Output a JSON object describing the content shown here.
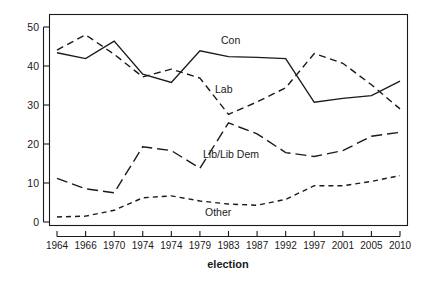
{
  "chart_data": {
    "type": "line",
    "title": "",
    "subtitle": "",
    "xlabel": "election",
    "ylabel": "",
    "categories": [
      "1964",
      "1966",
      "1970",
      "1974",
      "1974",
      "1979",
      "1983",
      "1987",
      "1992",
      "1997",
      "2001",
      "2005",
      "2010"
    ],
    "xtick_labels": [
      "1964",
      "1966",
      "1970",
      "1974",
      "1974",
      "1979",
      "1983",
      "1987",
      "1992",
      "1997",
      "2001",
      "2005",
      "2010"
    ],
    "ytick_labels": [
      "0",
      "10",
      "20",
      "30",
      "40",
      "50"
    ],
    "ytick_values": [
      0,
      10,
      20,
      30,
      40,
      50
    ],
    "ylim": [
      -1.5,
      52
    ],
    "xlim": [
      -0.55,
      12.55
    ],
    "grid": false,
    "legend_position": "inline-annotations",
    "series": [
      {
        "name": "Con",
        "label": "Con",
        "line_style": "solid",
        "color": "#1a1a1a",
        "values": [
          43.4,
          41.9,
          46.4,
          37.9,
          35.8,
          43.9,
          42.4,
          42.2,
          41.9,
          30.7,
          31.7,
          32.4,
          36.1
        ]
      },
      {
        "name": "Lab",
        "label": "Lab",
        "line_style": "dashed",
        "color": "#1a1a1a",
        "values": [
          44.1,
          48.0,
          43.0,
          37.2,
          39.2,
          36.9,
          27.6,
          30.8,
          34.4,
          43.2,
          40.7,
          35.2,
          29.0
        ]
      },
      {
        "name": "Lib/Lib Dem",
        "label": "Lib/Lib Dem",
        "line_style": "long-dashed",
        "color": "#1a1a1a",
        "values": [
          11.2,
          8.5,
          7.5,
          19.3,
          18.3,
          13.8,
          25.4,
          22.6,
          17.8,
          16.8,
          18.3,
          22.0,
          23.0
        ]
      },
      {
        "name": "Other",
        "label": "Other",
        "line_style": "short-dashed",
        "color": "#1a1a1a",
        "values": [
          1.3,
          1.5,
          3.0,
          6.2,
          6.7,
          5.4,
          4.6,
          4.3,
          5.8,
          9.3,
          9.3,
          10.4,
          11.9
        ]
      }
    ],
    "annotations": [
      {
        "text": "Con",
        "series": "Con",
        "x_px": 221,
        "y_px": 44
      },
      {
        "text": "Lab",
        "series": "Lab",
        "x_px": 215,
        "y_px": 93
      },
      {
        "text": "Lib/Lib Dem",
        "series": "Lib/Lib Dem",
        "x_px": 203,
        "y_px": 158
      },
      {
        "text": "Other",
        "series": "Other",
        "x_px": 205,
        "y_px": 216
      }
    ]
  }
}
